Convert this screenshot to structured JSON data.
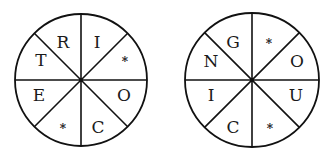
{
  "puzzle": {
    "wheels": [
      {
        "id": "left",
        "center": [
          81,
          80
        ],
        "radius": 66,
        "sectors": [
          {
            "position": "top-left-upper",
            "label": "R"
          },
          {
            "position": "top-right-upper",
            "label": "I"
          },
          {
            "position": "right-upper",
            "label": "*"
          },
          {
            "position": "right-lower",
            "label": "O"
          },
          {
            "position": "bottom-right",
            "label": "C"
          },
          {
            "position": "bottom-left",
            "label": "*"
          },
          {
            "position": "left-lower",
            "label": "E"
          },
          {
            "position": "left-upper",
            "label": "T"
          }
        ]
      },
      {
        "id": "right",
        "center": [
          252,
          80
        ],
        "radius": 67,
        "sectors": [
          {
            "position": "top-left-upper",
            "label": "G"
          },
          {
            "position": "top-right-upper",
            "label": "*"
          },
          {
            "position": "right-upper",
            "label": "O"
          },
          {
            "position": "right-lower",
            "label": "U"
          },
          {
            "position": "bottom-right",
            "label": "*"
          },
          {
            "position": "bottom-left",
            "label": "C"
          },
          {
            "position": "left-lower",
            "label": "I"
          },
          {
            "position": "left-upper",
            "label": "N"
          }
        ]
      }
    ],
    "colors": {
      "stroke": "#111111",
      "text": "#1a1a1a",
      "background": "#ffffff"
    }
  }
}
